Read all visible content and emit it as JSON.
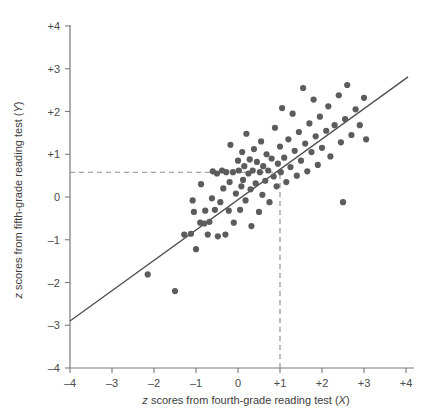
{
  "figure": {
    "background_color": "#ffffff",
    "point_color": "#5c5c5c",
    "line_color": "#4d4d4d",
    "axis_color": "#7a7a7a",
    "dashed_color": "#8a8a8a",
    "text_color": "#4a4a4a"
  },
  "chart_data": {
    "type": "scatter",
    "title": "",
    "xlabel": "z scores from fourth-grade reading test (X)",
    "ylabel": "z scores from fifth-grade reading test (Y)",
    "xlabel_parts": {
      "lead": "z",
      "rest": " scores from fourth-grade reading test (",
      "var": "X",
      "close": ")"
    },
    "ylabel_parts": {
      "lead": "z",
      "rest": " scores from fifth-grade reading test (",
      "var": "Y",
      "close": ")"
    },
    "xlim": [
      -4,
      4
    ],
    "ylim": [
      -4,
      4
    ],
    "xticks": [
      -4,
      -3,
      -2,
      -1,
      0,
      1,
      2,
      3,
      4
    ],
    "yticks": [
      -4,
      -3,
      -2,
      -1,
      0,
      1,
      2,
      3,
      4
    ],
    "xtick_labels": [
      "–4",
      "–3",
      "–2",
      "–1",
      "0",
      "+1",
      "+2",
      "+3",
      "+4"
    ],
    "ytick_labels": [
      "–4",
      "–3",
      "–2",
      "–1",
      "0",
      "+1",
      "+2",
      "+3",
      "+4"
    ],
    "grid": false,
    "legend": null,
    "regression_line": {
      "label": "least-squares regression line",
      "x": [
        -4,
        4.05
      ],
      "y": [
        -2.9,
        2.81
      ],
      "slope": 0.71,
      "intercept": -0.06
    },
    "guide_lines": [
      {
        "name": "prediction-horizontal",
        "orientation": "horizontal",
        "y": 0.58,
        "x_from": -4,
        "x_to": 1,
        "style": "dashed"
      },
      {
        "name": "prediction-vertical",
        "orientation": "vertical",
        "x": 1,
        "y_from": -4,
        "y_to": 0.58,
        "style": "dashed"
      }
    ],
    "points": [
      [
        -2.15,
        -1.81
      ],
      [
        -1.5,
        -2.2
      ],
      [
        -1.28,
        -0.88
      ],
      [
        -1.12,
        -0.86
      ],
      [
        -1.08,
        -0.08
      ],
      [
        -1.05,
        -0.35
      ],
      [
        -1.0,
        -1.22
      ],
      [
        -0.9,
        -0.6
      ],
      [
        -0.88,
        0.3
      ],
      [
        -0.8,
        -0.62
      ],
      [
        -0.78,
        -0.32
      ],
      [
        -0.72,
        -0.88
      ],
      [
        -0.68,
        -0.58
      ],
      [
        -0.62,
        -0.03
      ],
      [
        -0.6,
        0.6
      ],
      [
        -0.55,
        -0.3
      ],
      [
        -0.5,
        0.55
      ],
      [
        -0.48,
        -0.92
      ],
      [
        -0.42,
        -0.12
      ],
      [
        -0.38,
        0.62
      ],
      [
        -0.35,
        0.2
      ],
      [
        -0.3,
        -0.88
      ],
      [
        -0.28,
        0.58
      ],
      [
        -0.22,
        -0.32
      ],
      [
        -0.2,
        0.35
      ],
      [
        -0.18,
        1.22
      ],
      [
        -0.12,
        0.58
      ],
      [
        -0.1,
        -0.6
      ],
      [
        -0.05,
        0.08
      ],
      [
        0.0,
        0.85
      ],
      [
        0.02,
        0.62
      ],
      [
        0.05,
        -0.3
      ],
      [
        0.08,
        0.25
      ],
      [
        0.1,
        1.05
      ],
      [
        0.12,
        0.4
      ],
      [
        0.15,
        0.72
      ],
      [
        0.18,
        -0.08
      ],
      [
        0.2,
        1.48
      ],
      [
        0.25,
        0.55
      ],
      [
        0.28,
        0.88
      ],
      [
        0.3,
        0.18
      ],
      [
        0.32,
        -0.68
      ],
      [
        0.35,
        0.62
      ],
      [
        0.38,
        1.12
      ],
      [
        0.42,
        0.32
      ],
      [
        0.45,
        0.82
      ],
      [
        0.5,
        -0.35
      ],
      [
        0.52,
        0.58
      ],
      [
        0.55,
        1.3
      ],
      [
        0.58,
        0.05
      ],
      [
        0.6,
        0.72
      ],
      [
        0.65,
        0.38
      ],
      [
        0.68,
        1.0
      ],
      [
        0.72,
        0.62
      ],
      [
        0.75,
        -0.12
      ],
      [
        0.8,
        0.9
      ],
      [
        0.85,
        0.48
      ],
      [
        0.88,
        1.62
      ],
      [
        0.92,
        0.25
      ],
      [
        0.95,
        0.78
      ],
      [
        1.0,
        1.18
      ],
      [
        1.02,
        0.58
      ],
      [
        1.05,
        2.08
      ],
      [
        1.1,
        0.92
      ],
      [
        1.15,
        0.35
      ],
      [
        1.2,
        1.35
      ],
      [
        1.25,
        0.7
      ],
      [
        1.3,
        1.95
      ],
      [
        1.35,
        1.08
      ],
      [
        1.4,
        0.5
      ],
      [
        1.45,
        1.52
      ],
      [
        1.5,
        0.85
      ],
      [
        1.55,
        2.55
      ],
      [
        1.6,
        1.25
      ],
      [
        1.65,
        0.6
      ],
      [
        1.7,
        1.72
      ],
      [
        1.75,
        1.05
      ],
      [
        1.8,
        2.28
      ],
      [
        1.85,
        1.42
      ],
      [
        1.9,
        0.75
      ],
      [
        1.95,
        1.88
      ],
      [
        2.0,
        1.15
      ],
      [
        2.1,
        1.55
      ],
      [
        2.15,
        2.12
      ],
      [
        2.2,
        0.95
      ],
      [
        2.3,
        1.68
      ],
      [
        2.4,
        2.38
      ],
      [
        2.45,
        1.28
      ],
      [
        2.5,
        -0.12
      ],
      [
        2.55,
        1.82
      ],
      [
        2.6,
        2.62
      ],
      [
        2.7,
        1.45
      ],
      [
        2.8,
        2.05
      ],
      [
        2.9,
        1.68
      ],
      [
        3.0,
        2.32
      ],
      [
        3.05,
        1.35
      ]
    ]
  }
}
